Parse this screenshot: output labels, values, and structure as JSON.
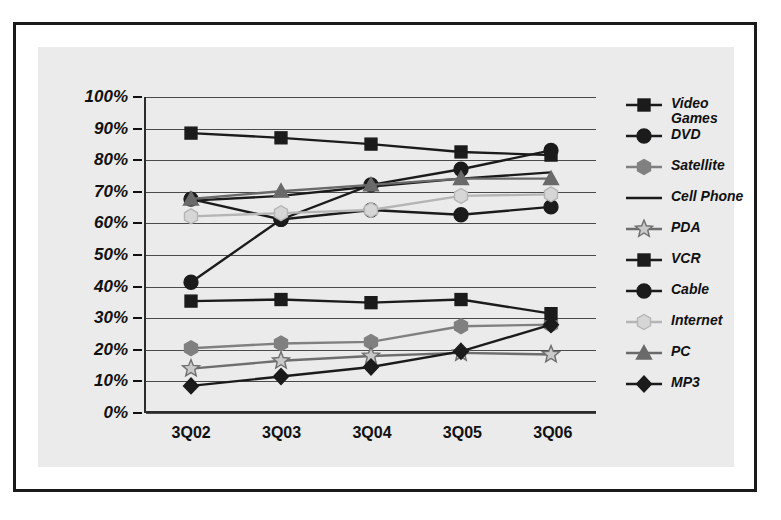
{
  "figure": {
    "background": "#ffffff",
    "panel_background": "#ebebeb",
    "border_color": "#1a1a1a"
  },
  "chart_data": {
    "type": "line",
    "title": "",
    "xlabel": "",
    "ylabel": "",
    "x": [
      "3Q02",
      "3Q03",
      "3Q04",
      "3Q05",
      "3Q06"
    ],
    "categories": [
      "3Q02",
      "3Q03",
      "3Q04",
      "3Q05",
      "3Q06"
    ],
    "ylim": [
      0,
      100
    ],
    "y_tick_labels": [
      "100%",
      "90%",
      "80%",
      "70%",
      "60%",
      "50%",
      "40%",
      "30%",
      "20%",
      "10%",
      "0%"
    ],
    "y_tick_values": [
      100,
      90,
      80,
      70,
      60,
      50,
      40,
      30,
      20,
      10,
      0
    ],
    "grid": true,
    "grid_axis": "y",
    "legend_position": "right",
    "value_unit": "percent",
    "series": [
      {
        "name": "Video Games",
        "label": "Video\nGames",
        "marker": "square",
        "color": "#1b1b1b",
        "marker_fill": "#1b1b1b",
        "values": [
          88.5,
          87,
          85,
          82.5,
          81.5
        ]
      },
      {
        "name": "DVD",
        "label": "DVD",
        "marker": "circle",
        "color": "#1b1b1b",
        "marker_fill": "#1b1b1b",
        "values": [
          41,
          61,
          72,
          77,
          83
        ]
      },
      {
        "name": "Satellite",
        "label": "Satellite",
        "marker": "hexagon",
        "color": "#808080",
        "marker_fill": "#808080",
        "values": [
          20,
          21.5,
          22,
          27,
          27.5
        ]
      },
      {
        "name": "Cell Phone",
        "label": "Cell Phone",
        "marker": "none",
        "color": "#1b1b1b",
        "marker_fill": "#1b1b1b",
        "values": [
          67,
          68.5,
          71.5,
          74,
          76
        ]
      },
      {
        "name": "PDA",
        "label": "PDA",
        "marker": "star",
        "color": "#6e6e6e",
        "marker_fill": "#c9c9c9",
        "values": [
          13.5,
          16,
          17.5,
          18.5,
          18
        ]
      },
      {
        "name": "VCR",
        "label": "VCR",
        "marker": "square",
        "color": "#1b1b1b",
        "marker_fill": "#1b1b1b",
        "values": [
          35,
          35.5,
          34.5,
          35.5,
          31
        ]
      },
      {
        "name": "Cable",
        "label": "Cable",
        "marker": "circle",
        "color": "#1b1b1b",
        "marker_fill": "#1b1b1b",
        "values": [
          67.5,
          61,
          64,
          62.5,
          65
        ]
      },
      {
        "name": "Internet",
        "label": "Internet",
        "marker": "hexagon",
        "color": "#b5b5b5",
        "marker_fill": "#d6d6d6",
        "values": [
          62,
          63,
          64,
          68.5,
          69
        ]
      },
      {
        "name": "PC",
        "label": "PC",
        "marker": "triangle",
        "color": "#6a6a6a",
        "marker_fill": "#6a6a6a",
        "values": [
          67.5,
          70,
          72,
          74,
          74
        ]
      },
      {
        "name": "MP3",
        "label": "MP3",
        "marker": "diamond",
        "color": "#1b1b1b",
        "marker_fill": "#1b1b1b",
        "values": [
          8,
          11,
          14,
          19,
          27.5
        ]
      }
    ]
  }
}
